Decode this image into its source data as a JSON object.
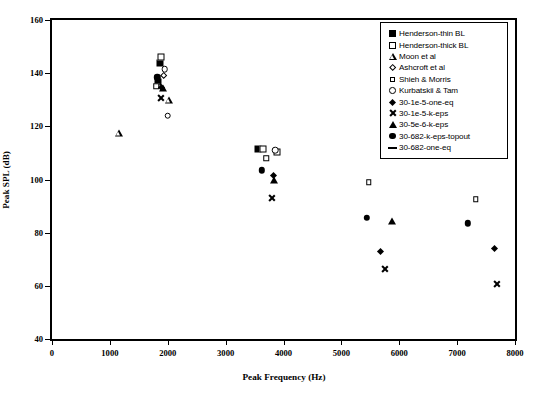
{
  "chart_data": {
    "type": "scatter",
    "title": "",
    "xlabel": "Peak Frequency (Hz)",
    "ylabel": "Peak SPL (dB)",
    "xlim": [
      0,
      8000
    ],
    "ylim": [
      40,
      160
    ],
    "xticks": [
      0,
      1000,
      2000,
      3000,
      4000,
      5000,
      6000,
      7000,
      8000
    ],
    "yticks": [
      40,
      60,
      80,
      100,
      120,
      140,
      160
    ],
    "grid": false,
    "legend_position": "top-right",
    "series": [
      {
        "name": "Henderson-thin BL",
        "marker": "filled-square",
        "points": [
          [
            1870,
            144.0
          ],
          [
            1830,
            136.5
          ],
          [
            3560,
            111.5
          ]
        ]
      },
      {
        "name": "Henderson-thick BL",
        "marker": "open-square",
        "points": [
          [
            1890,
            146.0
          ],
          [
            3640,
            111.5
          ],
          [
            3880,
            110.5
          ]
        ]
      },
      {
        "name": "Moon et al",
        "marker": "open-triangle",
        "points": [
          [
            1150,
            117.5
          ],
          [
            2020,
            132.5
          ]
        ]
      },
      {
        "name": "Ashcroft et al",
        "marker": "open-diamond",
        "points": [
          [
            1890,
            140.0
          ]
        ]
      },
      {
        "name": "Shieh & Morris",
        "marker": "small-open-square",
        "points": [
          [
            1800,
            135.0
          ],
          [
            3700,
            108.0
          ],
          [
            5470,
            99.0
          ],
          [
            7320,
            92.5
          ]
        ]
      },
      {
        "name": "Kurbatskii & Tam",
        "marker": "open-circle",
        "points": [
          [
            1950,
            141.5
          ],
          [
            2000,
            124.0
          ],
          [
            3860,
            111.0
          ]
        ]
      },
      {
        "name": "30-1e-5-one-eq",
        "marker": "filled-diamond",
        "points": [
          [
            1855,
            135.5
          ],
          [
            3790,
            102.5
          ],
          [
            5640,
            74.0
          ],
          [
            7600,
            75.0
          ]
        ]
      },
      {
        "name": "30-1e-5-k-eps",
        "marker": "cross",
        "points": [
          [
            1880,
            136.0
          ],
          [
            3800,
            101.5
          ],
          [
            5750,
            77.5
          ],
          [
            7680,
            75.0
          ]
        ]
      },
      {
        "name": "30-5e-6-k-eps",
        "marker": "filled-triangle",
        "points": [
          [
            1920,
            134.5
          ],
          [
            3840,
            100.0
          ],
          [
            5880,
            84.5
          ]
        ]
      },
      {
        "name": "30-682-k-eps-topout",
        "marker": "filled-circle",
        "points": [
          [
            1820,
            138.5
          ],
          [
            3620,
            103.5
          ],
          [
            5440,
            85.5
          ],
          [
            7180,
            83.5
          ]
        ]
      },
      {
        "name": "30-682-one-eq",
        "marker": "dash",
        "points": []
      }
    ]
  }
}
